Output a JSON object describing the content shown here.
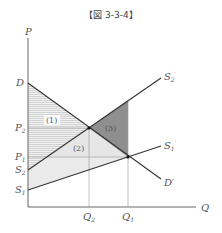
{
  "title": "【図 3-3-4】",
  "axes": {
    "y_label": "P",
    "x_label": "Q"
  },
  "curves": {
    "demand_start": "D",
    "demand_end": "D′",
    "supply2_start": "S",
    "supply2_start_sub": "2",
    "supply2_end": "S",
    "supply2_end_sub": "2",
    "supply1_start": "S",
    "supply1_start_sub": "1",
    "supply1_end": "S",
    "supply1_end_sub": "1"
  },
  "prices": {
    "p2": "P",
    "p2_sub": "2",
    "p1": "P",
    "p1_sub": "1"
  },
  "quantities": {
    "q2": "Q",
    "q2_sub": "2",
    "q1": "Q",
    "q1_sub": "1"
  },
  "regions": {
    "r1": "(1)",
    "r2": "(2)",
    "r3": "(3)"
  },
  "colors": {
    "axis": "#555555",
    "line": "#333333",
    "region1_hatch": "#c8c8c8",
    "region2_fill": "#ececec",
    "region3_fill": "#8c8c8c",
    "guide": "#999999"
  }
}
